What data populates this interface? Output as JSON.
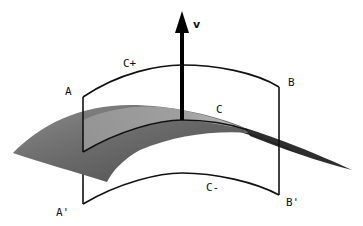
{
  "diagram": {
    "type": "geometric-surface-illustration",
    "labels": {
      "normal": "v",
      "top_curve": "C+",
      "middle_curve": "C",
      "bottom_curve": "C-",
      "corner_top_left": "A",
      "corner_top_right": "B",
      "corner_bottom_left": "A'",
      "corner_bottom_right": "B'"
    },
    "colors": {
      "line": "#111111",
      "surface_light": "#b8b8b8",
      "surface_dark": "#555555",
      "surface_tail": "#2a2a2a",
      "background": "#ffffff"
    },
    "elements": [
      {
        "id": "surface",
        "description": "curved shaded surface"
      },
      {
        "id": "normal-vector",
        "label": "v",
        "description": "upward arrow normal to surface at C"
      },
      {
        "id": "curve-c-plus",
        "label": "C+",
        "description": "upper curve from A to B"
      },
      {
        "id": "curve-c",
        "label": "C",
        "description": "curve lying on surface"
      },
      {
        "id": "curve-c-minus",
        "label": "C-",
        "description": "lower curve from A' to B'"
      },
      {
        "id": "edge-left",
        "description": "vertical segment A to A'"
      },
      {
        "id": "edge-right",
        "description": "vertical segment B to B'"
      }
    ]
  }
}
